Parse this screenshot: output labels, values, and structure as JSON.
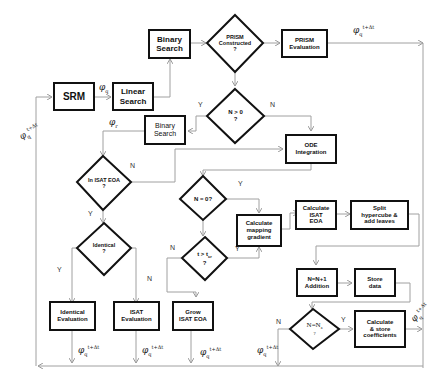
{
  "diagram": {
    "nodes": {
      "srm": "SRM",
      "linear_search": "Linear\nSearch",
      "binary_search_top": "Binary\nSearch",
      "prism_constructed": "PRISM\nConstructed\n?",
      "prism_evaluation": "PRISM\nEvaluation",
      "n_gt_0": "N > 0\n?",
      "binary_search_mid": "Binary\nSearch",
      "ode_integration": "ODE\nIntegration",
      "in_isat_eoa": "In ISAT EOA\n?",
      "n_eq_0": "N = 0?",
      "calc_mapping_gradient": "Calculate\nmapping\ngradient",
      "calc_isat_eoa": "Calculate\nISAT\nEOA",
      "split_hypercube": "Split\nhypercube &\nadd leaves",
      "t_gt_tcr": "t > t",
      "t_gt_tcr_sub": "cr",
      "t_gt_tcr_q": "?",
      "identical": "Identical\n?",
      "identical_evaluation": "Identical\nEvaluation",
      "isat_evaluation": "ISAT\nEvaluation",
      "grow_isat_eoa": "Grow\nISAT EOA",
      "n_addition": "N=N+1\nAddition",
      "store_data": "Store\ndata",
      "n_eq_na": "N=N",
      "n_eq_na_sub": "a",
      "n_eq_na_q": "?",
      "calc_store_coeff": "Calculate\n& store\ncoefficients"
    },
    "edge_labels": {
      "yes": "Y",
      "no": "N"
    },
    "symbols": {
      "phi": "φ",
      "sub_q": "q",
      "sub_r": "r",
      "sup_t_dt": "t+Δt"
    }
  }
}
